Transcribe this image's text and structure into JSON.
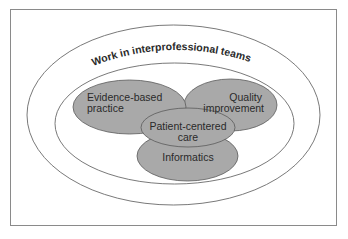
{
  "diagram": {
    "title": "Work in interprofessional teams",
    "colors": {
      "frame": "#8a8a8a",
      "ellipse_stroke": "#6a6a6a",
      "fill": "#a9a9a9",
      "text": "#2a2a2a",
      "background": "#ffffff"
    },
    "nodes": [
      {
        "id": "evidence-based-practice",
        "line1": "Evidence-based",
        "line2": "practice"
      },
      {
        "id": "quality-improvement",
        "line1": "Quality",
        "line2": "improvement"
      },
      {
        "id": "informatics",
        "line1": "Informatics"
      },
      {
        "id": "patient-centered-care",
        "line1": "Patient-centered",
        "line2": "care"
      }
    ]
  }
}
